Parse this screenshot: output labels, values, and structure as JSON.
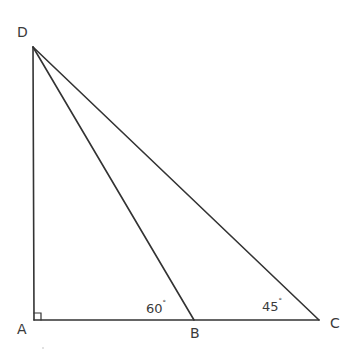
{
  "figure": {
    "type": "geometry-triangle",
    "stroke_color": "#333333",
    "points": {
      "D": {
        "label": "D",
        "x": 33,
        "y": 47
      },
      "A": {
        "label": "A",
        "x": 34,
        "y": 320
      },
      "B": {
        "label": "B",
        "x": 194,
        "y": 320
      },
      "C": {
        "label": "C",
        "x": 319,
        "y": 320
      }
    },
    "segments": [
      "DA",
      "AC",
      "DB",
      "DC"
    ],
    "right_angle_at": "A",
    "angles": {
      "B": {
        "value": "60",
        "unit": "°"
      },
      "C": {
        "value": "45",
        "unit": "°"
      }
    }
  }
}
